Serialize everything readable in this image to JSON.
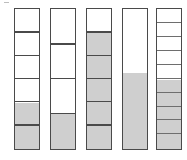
{
  "figure": {
    "title": "",
    "background_color": "#ffffff",
    "outline_color": "#4a4a4a",
    "fill_color": "#cfcfcf",
    "empty_color": "#ffffff",
    "tick_mark": {
      "label": "tick-mark",
      "visible": true
    }
  },
  "chart_data": {
    "type": "bar",
    "title": "",
    "xlabel": "",
    "ylabel": "",
    "ylim": [
      0,
      1
    ],
    "grid": false,
    "legend": null,
    "orientation": "vertical",
    "categories": [
      "Bar 1",
      "Bar 2",
      "Bar 3",
      "Bar 4",
      "Bar 5"
    ],
    "values": [
      0.3333,
      0.25,
      0.8333,
      0.55,
      0.5
    ],
    "bars": [
      {
        "name": "Bar 1",
        "segments": 6,
        "filled_segments": 2,
        "fraction": "2/6",
        "fill_ratio": 0.3333,
        "x": 14,
        "width": 26
      },
      {
        "name": "Bar 2",
        "segments": 4,
        "filled_segments": 1,
        "fraction": "1/4",
        "fill_ratio": 0.25,
        "x": 50,
        "width": 26
      },
      {
        "name": "Bar 3",
        "segments": 6,
        "filled_segments": 5,
        "fraction": "5/6",
        "fill_ratio": 0.8333,
        "x": 86,
        "width": 26
      },
      {
        "name": "Bar 4",
        "segments": 1,
        "filled_segments": 0,
        "fraction": "",
        "fill_ratio": 0.55,
        "x": 122,
        "width": 26
      },
      {
        "name": "Bar 5",
        "segments": 10,
        "filled_segments": 5,
        "fraction": "5/10",
        "fill_ratio": 0.5,
        "x": 156,
        "width": 26
      }
    ],
    "bar_top": 8,
    "bar_bottom": 150
  }
}
